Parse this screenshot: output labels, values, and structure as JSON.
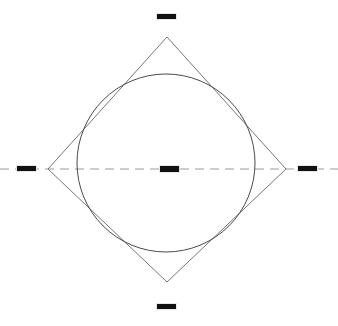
{
  "figure": {
    "canvas": {
      "width": 338,
      "height": 326,
      "background": "#ffffff"
    },
    "colors": {
      "diamond_stroke": "#777777",
      "circle_stroke": "#4a4a4a",
      "axis_stroke": "#9a9a9a",
      "marker_fill": "#111111"
    },
    "shapes": {
      "diamond": {
        "name": "square-rotated-45",
        "stroke_width": 1,
        "fill": "none",
        "points": "167,37 286,169 167,282 48,169",
        "vertices": [
          {
            "name": "top",
            "x": 167,
            "y": 37
          },
          {
            "name": "right",
            "x": 286,
            "y": 169
          },
          {
            "name": "bottom",
            "x": 167,
            "y": 282
          },
          {
            "name": "left",
            "x": 48,
            "y": 169
          }
        ]
      },
      "circle": {
        "name": "inscribed-circle",
        "cx": 166,
        "cy": 163,
        "r": 89,
        "stroke_width": 1,
        "fill": "none"
      },
      "axis": {
        "name": "horizontal-center-axis",
        "x1": 0,
        "y1": 169,
        "x2": 338,
        "y2": 169,
        "stroke_width": 1,
        "dash": "9 6"
      }
    },
    "markers": [
      {
        "name": "top-label-marker",
        "x": 156,
        "y": 13,
        "w": 19,
        "h": 5
      },
      {
        "name": "left-label-marker",
        "x": 16,
        "y": 165,
        "w": 19,
        "h": 5
      },
      {
        "name": "center-label-marker",
        "x": 159,
        "y": 165,
        "w": 19,
        "h": 6
      },
      {
        "name": "right-label-marker",
        "x": 297,
        "y": 165,
        "w": 19,
        "h": 5
      },
      {
        "name": "bottom-label-marker",
        "x": 156,
        "y": 303,
        "w": 19,
        "h": 5
      }
    ]
  }
}
